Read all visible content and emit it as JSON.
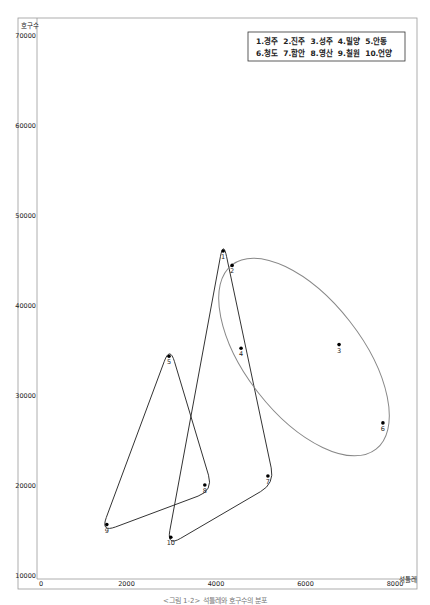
{
  "chart_data": {
    "type": "scatter",
    "title": "",
    "xlabel": "석틀레",
    "ylabel": "호구수",
    "xlim": [
      0,
      8000
    ],
    "ylim": [
      10000,
      70000
    ],
    "x_ticks": [
      0,
      2000,
      4000,
      6000,
      8000
    ],
    "x_tick_labels": [
      "0",
      "2000",
      "4000",
      "6000",
      "8000"
    ],
    "y_ticks": [
      10000,
      20000,
      30000,
      40000,
      50000,
      60000,
      70000
    ],
    "y_tick_labels": [
      "10000",
      "20000",
      "30000",
      "40000",
      "50000",
      "60000",
      "70000"
    ],
    "grid": false,
    "legend_position": "top-right",
    "legend": {
      "rows": [
        "1.경주  2.진주  3.성주  4.밀양  5.안동",
        "6.청도  7.함안  8.영산  9.칠원  10.언양"
      ]
    },
    "points": [
      {
        "id": 1,
        "name": "경주",
        "x": 4160,
        "y": 46000
      },
      {
        "id": 2,
        "name": "진주",
        "x": 4360,
        "y": 44400
      },
      {
        "id": 3,
        "name": "성주",
        "x": 6750,
        "y": 35600
      },
      {
        "id": 4,
        "name": "밀양",
        "x": 4560,
        "y": 35200
      },
      {
        "id": 5,
        "name": "안동",
        "x": 2950,
        "y": 34300
      },
      {
        "id": 6,
        "name": "청도",
        "x": 7730,
        "y": 26900
      },
      {
        "id": 7,
        "name": "함안",
        "x": 5160,
        "y": 21000
      },
      {
        "id": 8,
        "name": "영산",
        "x": 3750,
        "y": 20000
      },
      {
        "id": 9,
        "name": "칠원",
        "x": 1560,
        "y": 15600
      },
      {
        "id": 10,
        "name": "언양",
        "x": 2990,
        "y": 14200
      }
    ],
    "groups": [
      {
        "name": "group-triangle-large",
        "members": [
          1,
          7,
          10
        ],
        "shape": "rounded-triangle",
        "color": "#333333"
      },
      {
        "name": "group-triangle-small",
        "members": [
          5,
          8,
          9
        ],
        "shape": "rounded-triangle",
        "color": "#333333"
      },
      {
        "name": "group-ellipse",
        "members": [
          2,
          3,
          4,
          6
        ],
        "shape": "ellipse",
        "color": "#888888"
      }
    ]
  },
  "caption": "<그림 1-2> 석틀레와 호구수의 분포"
}
